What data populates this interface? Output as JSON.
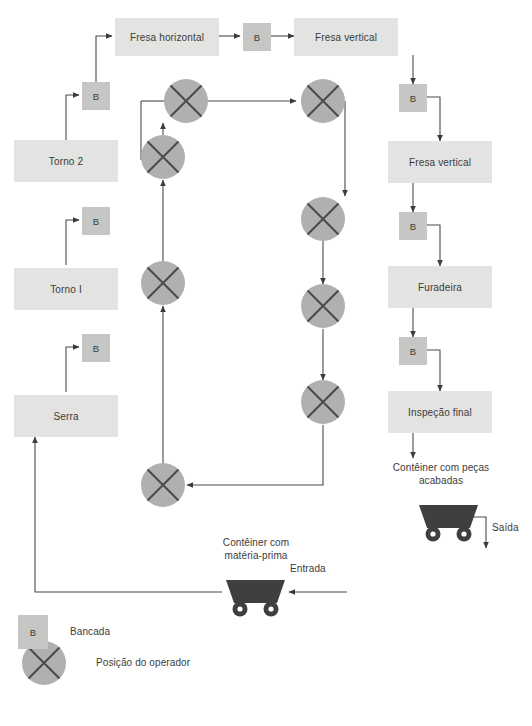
{
  "diagram": {
    "colors": {
      "machine_fill": "#e3e3e1",
      "bench_fill": "#c6c6c4",
      "operator_fill": "#b0b0ae",
      "cart_fill": "#3f3f3f",
      "line": "#4a4a4a",
      "text": "#3b3b3b"
    },
    "machines": [
      {
        "id": "fresa-horizontal",
        "label": "Fresa horizontal"
      },
      {
        "id": "fresa-vertical-top",
        "label": "Fresa vertical"
      },
      {
        "id": "fresa-vertical-right",
        "label": "Fresa vertical"
      },
      {
        "id": "furadeira",
        "label": "Furadeira"
      },
      {
        "id": "inspecao-final",
        "label": "Inspeção final"
      },
      {
        "id": "serra",
        "label": "Serra"
      },
      {
        "id": "torno-1",
        "label": "Torno I"
      },
      {
        "id": "torno-2",
        "label": "Torno 2"
      }
    ],
    "benches": [
      {
        "id": "bench-torno2",
        "label": "B"
      },
      {
        "id": "bench-torno1",
        "label": "B"
      },
      {
        "id": "bench-serra",
        "label": "B"
      },
      {
        "id": "bench-fresa-mid",
        "label": "B"
      },
      {
        "id": "bench-fresa-vert-right",
        "label": "B"
      },
      {
        "id": "bench-furadeira",
        "label": "B"
      },
      {
        "id": "bench-inspecao",
        "label": "B"
      }
    ],
    "operators": [
      {
        "id": "op-1"
      },
      {
        "id": "op-2"
      },
      {
        "id": "op-3"
      },
      {
        "id": "op-4"
      },
      {
        "id": "op-5"
      },
      {
        "id": "op-6"
      },
      {
        "id": "op-7"
      },
      {
        "id": "op-8"
      }
    ],
    "annotations": {
      "container_raw_line1": "Contêiner com",
      "container_raw_line2": "matéria-prima",
      "container_finished_line1": "Contêiner com peças",
      "container_finished_line2": "acabadas",
      "entrada": "Entrada",
      "saida": "Saída"
    },
    "legend": [
      {
        "id": "legend-bancada",
        "symbol": "B",
        "label": "Bancada"
      },
      {
        "id": "legend-operador",
        "symbol": "",
        "label": "Posição do operador"
      }
    ]
  }
}
